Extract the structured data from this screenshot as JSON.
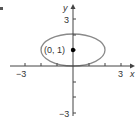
{
  "figure": {
    "partial_label": "c.",
    "axes": {
      "x_label": "x",
      "y_label": "y",
      "x_ticks": [
        -3,
        -2,
        -1,
        1,
        2,
        3
      ],
      "y_ticks": [
        -3,
        -2,
        -1,
        1,
        2,
        3
      ],
      "x_tick_labels": {
        "neg": "−3",
        "pos": "3"
      },
      "y_tick_labels": {
        "neg": "−3",
        "pos": "3"
      }
    },
    "ellipse": {
      "center": [
        0,
        1
      ],
      "semi_axis_x": 2,
      "semi_axis_y": 1,
      "stroke_color": "#8a8a8a"
    },
    "point": {
      "coords": [
        0,
        1
      ],
      "label": "(0, 1)",
      "color": "#000000"
    }
  }
}
